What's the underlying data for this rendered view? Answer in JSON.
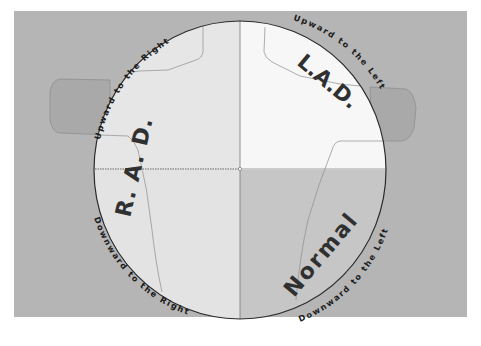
{
  "diagram": {
    "colors": {
      "page_background": "#ffffff",
      "outer_background": "#b3b3b3",
      "lobe_fill": "#a8a8a8",
      "quad_upper_left": "#e4e4e4",
      "quad_upper_right": "#f6f6f6",
      "quad_lower_left": "#e2e2e2",
      "quad_lower_right": "#c4c4c4",
      "circle_stroke": "#2a2a2a",
      "text": "#1a1a1a"
    },
    "quadrant_labels": {
      "rad": "R. A. D.",
      "lad": "L.A.D.",
      "normal": "Normal"
    },
    "arc_labels": {
      "upper_left": "Upward to the Right",
      "upper_right": "Upward to the Left",
      "lower_left": "Downward to the Right",
      "lower_right": "Downward to the Left"
    }
  }
}
